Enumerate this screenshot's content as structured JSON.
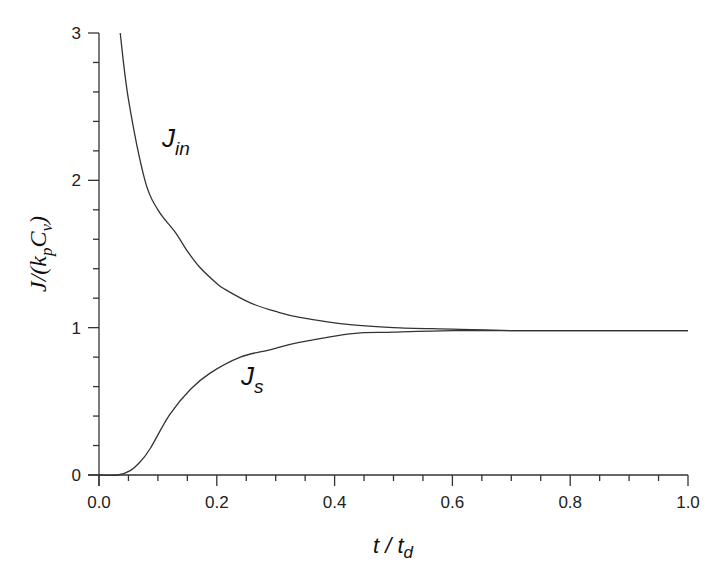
{
  "chart_data": {
    "type": "line",
    "title": "",
    "xlabel": "t / t_d",
    "xlabel_parts": {
      "main": "t / t",
      "sub": "d"
    },
    "ylabel": "J/(k_p C_v)",
    "ylabel_parts": {
      "a": "J/(k",
      "sub1": "p",
      "b": "C",
      "sub2": "v",
      "c": ")"
    },
    "xlim": [
      0,
      1
    ],
    "ylim": [
      0,
      3
    ],
    "xticks": [
      "0.0",
      "0.2",
      "0.4",
      "0.6",
      "0.8",
      "1.0"
    ],
    "yticks": [
      "0",
      "1",
      "2",
      "3"
    ],
    "grid": false,
    "legend": "none (inline curve labels)",
    "series": [
      {
        "name": "J_in",
        "label_main": "J",
        "label_sub": "in",
        "x": [
          0.036,
          0.05,
          0.078,
          0.1,
          0.129,
          0.15,
          0.171,
          0.2,
          0.214,
          0.256,
          0.3,
          0.341,
          0.426,
          0.5,
          0.6,
          0.7,
          0.8,
          0.9,
          1.0
        ],
        "y": [
          3.0,
          2.55,
          2.0,
          1.8,
          1.65,
          1.52,
          1.41,
          1.3,
          1.26,
          1.17,
          1.11,
          1.07,
          1.02,
          1.0,
          0.99,
          0.98,
          0.98,
          0.98,
          0.98
        ]
      },
      {
        "name": "J_s",
        "label_main": "J",
        "label_sub": "s",
        "x": [
          0.0,
          0.032,
          0.053,
          0.07,
          0.087,
          0.12,
          0.155,
          0.188,
          0.24,
          0.29,
          0.34,
          0.43,
          0.5,
          0.6,
          0.7,
          0.8,
          0.9,
          1.0
        ],
        "y": [
          0.0,
          0.0,
          0.03,
          0.09,
          0.18,
          0.41,
          0.58,
          0.69,
          0.8,
          0.85,
          0.9,
          0.96,
          0.97,
          0.98,
          0.98,
          0.98,
          0.98,
          0.98
        ]
      }
    ],
    "annotations": [
      {
        "text": "J_in",
        "x": 0.12,
        "y": 2.28
      },
      {
        "text": "J_s",
        "x": 0.245,
        "y": 0.6
      }
    ]
  },
  "style": {
    "line_color": "#333333",
    "axis_color": "#333333",
    "background": "#ffffff"
  }
}
